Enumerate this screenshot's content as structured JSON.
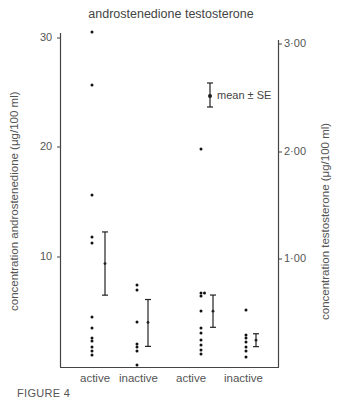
{
  "chart_data": {
    "type": "scatter",
    "title": "androstenedione testosterone",
    "figure_label": "FIGURE 4",
    "left_axis": {
      "label": "concentration androstenedione (μg/100 ml)",
      "ticks": [
        "10",
        "20",
        "30"
      ],
      "tick_values": [
        10,
        20,
        30
      ],
      "range": [
        0,
        31
      ]
    },
    "right_axis": {
      "label": "concentration testosterone (μg/100 ml)",
      "ticks": [
        "1·00",
        "2·00",
        "3·00"
      ],
      "tick_values": [
        1.0,
        2.0,
        3.0
      ],
      "range": [
        0,
        3.1
      ]
    },
    "categories": [
      "active",
      "inactive",
      "active",
      "inactive"
    ],
    "legend": {
      "symbol": "error-bar",
      "label": "mean ± SE"
    },
    "series": [
      {
        "name": "androstenedione active",
        "axis": "left",
        "points": [
          30.6,
          25.8,
          15.7,
          11.8,
          11.3,
          4.5,
          3.5,
          2.6,
          2.3,
          1.7,
          1.4,
          1.0
        ],
        "mean": 9.4,
        "se_low": 6.5,
        "se_high": 12.3
      },
      {
        "name": "androstenedione inactive",
        "axis": "left",
        "points": [
          7.4,
          7.0,
          4.0,
          2.0,
          1.7,
          1.4,
          0.1
        ],
        "mean": 4.0,
        "se_low": 1.8,
        "se_high": 6.1
      },
      {
        "name": "testosterone active",
        "axis": "right",
        "points": [
          2.02,
          0.68,
          0.68,
          0.65,
          0.51,
          0.35,
          0.31,
          0.24,
          0.2,
          0.15,
          0.11
        ],
        "mean": 0.51,
        "se_low": 0.36,
        "se_high": 0.66
      },
      {
        "name": "testosterone inactive",
        "axis": "right",
        "points": [
          0.52,
          0.29,
          0.26,
          0.22,
          0.18,
          0.14,
          0.08
        ],
        "mean": 0.24,
        "se_low": 0.18,
        "se_high": 0.3
      }
    ]
  },
  "labels": {
    "title": "androstenedione testosterone",
    "ylabel_left": "concentration androstenedione (μg/100 ml)",
    "ylabel_right": "concentration testosterone (μg/100 ml)",
    "legend": "mean ± SE",
    "figure": "FIGURE 4",
    "left_ticks": [
      "30",
      "20",
      "10"
    ],
    "right_ticks": [
      "3·00",
      "2·00",
      "1·00"
    ],
    "categories": [
      "active",
      "inactive",
      "active",
      "inactive"
    ]
  }
}
